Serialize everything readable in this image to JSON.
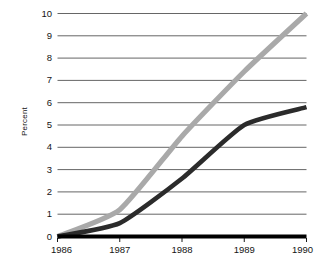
{
  "chart_data": {
    "type": "line",
    "title": "",
    "xlabel": "",
    "ylabel": "Percent",
    "x": [
      1986,
      1987,
      1988,
      1989,
      1990
    ],
    "xticklabels": [
      "1986",
      "1987",
      "1988",
      "1989",
      "1990"
    ],
    "xlim": [
      1986,
      1990
    ],
    "ylim": [
      0,
      10
    ],
    "yticks": [
      0,
      1,
      2,
      3,
      4,
      5,
      6,
      7,
      8,
      9,
      10
    ],
    "yticklabels": [
      "0",
      "1",
      "2",
      "3",
      "4",
      "5",
      "6",
      "7",
      "8",
      "9",
      "10"
    ],
    "grid": "horizontal",
    "legend": "none",
    "series": [
      {
        "name": "light-gray-series",
        "color": "#a9a9a9",
        "values": [
          0,
          1.2,
          4.5,
          7.4,
          10.0
        ]
      },
      {
        "name": "dark-series",
        "color": "#2b2b2b",
        "values": [
          0,
          0.6,
          2.6,
          5.0,
          5.8
        ]
      },
      {
        "name": "baseline-series",
        "color": "#000000",
        "values": [
          0,
          0,
          0,
          0,
          0
        ]
      }
    ]
  },
  "axes": {
    "y_axis_title": "Percent"
  }
}
